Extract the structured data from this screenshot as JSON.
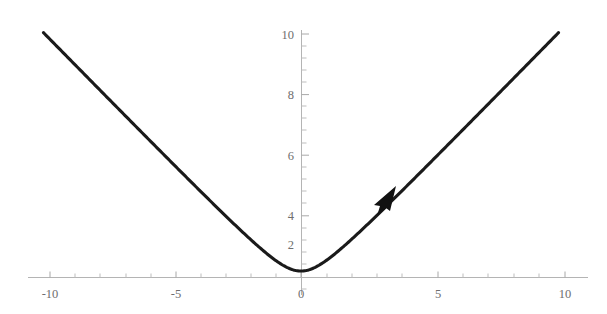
{
  "chart_data": {
    "type": "line",
    "title": "",
    "subtitle": "",
    "xlabel": "",
    "ylabel": "",
    "xlim": [
      -10,
      10
    ],
    "ylim": [
      0,
      10
    ],
    "grid": false,
    "legend": null,
    "legend_position": "none",
    "x_ticks": [
      -10,
      -5,
      0,
      5,
      10
    ],
    "x_tick_labels": [
      "-10",
      "-5",
      "0",
      "5",
      "10"
    ],
    "y_ticks": [
      2,
      4,
      6,
      8,
      10
    ],
    "y_tick_labels": [
      "2",
      "4",
      "6",
      "8",
      "10"
    ],
    "x_minor_tick_step": 1,
    "y_minor_tick_step": 0.5,
    "axis_color": "#b4b4b4",
    "tick_label_color": "#6e6e6e",
    "curve_color": "#1a1a1a",
    "annotations": [
      {
        "type": "arrowhead",
        "name": "direction-arrow",
        "x": 3.1,
        "y": 3.25,
        "direction": "up-right",
        "color": "#111111"
      }
    ],
    "series": [
      {
        "name": "sqrt(x^2 + 1)",
        "formula": "y = sqrt(x^2 + 1)",
        "vertex": [
          0,
          1
        ],
        "x": [
          -10,
          -9.5,
          -9,
          -8.5,
          -8,
          -7.5,
          -7,
          -6.5,
          -6,
          -5.5,
          -5,
          -4.5,
          -4,
          -3.5,
          -3,
          -2.5,
          -2,
          -1.5,
          -1,
          -0.5,
          0,
          0.5,
          1,
          1.5,
          2,
          2.5,
          3,
          3.5,
          4,
          4.5,
          5,
          5.5,
          6,
          6.5,
          7,
          7.5,
          8,
          8.5,
          9,
          9.5,
          10
        ],
        "values": [
          10.05,
          9.55,
          9.06,
          8.56,
          8.06,
          7.57,
          7.07,
          6.58,
          6.08,
          5.59,
          5.1,
          4.61,
          4.12,
          3.64,
          3.16,
          2.69,
          2.24,
          1.8,
          1.41,
          1.12,
          1.0,
          1.12,
          1.41,
          1.8,
          2.24,
          2.69,
          3.16,
          3.64,
          4.12,
          4.61,
          5.1,
          5.59,
          6.08,
          6.58,
          7.07,
          7.57,
          8.06,
          8.56,
          9.06,
          9.55,
          10.05
        ]
      }
    ]
  },
  "labels": {
    "x": {
      "neg_ten": "-10",
      "neg_five": "-5",
      "zero": "0",
      "five": "5",
      "ten": "10"
    },
    "y": {
      "two": "2",
      "four": "4",
      "six": "6",
      "eight": "8",
      "ten": "10"
    }
  }
}
